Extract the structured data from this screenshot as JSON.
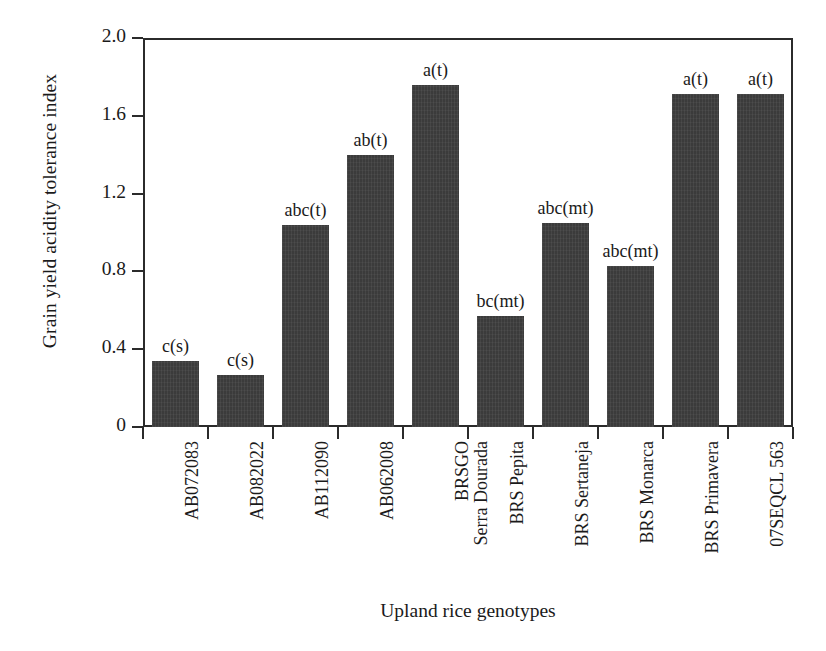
{
  "chart_data": {
    "type": "bar",
    "title": "",
    "xlabel": "Upland rice genotypes",
    "ylabel": "Grain yield acidity tolerance index",
    "ylim": [
      0,
      2.0
    ],
    "yticks": [
      "0",
      "0.4",
      "0.8",
      "1.2",
      "1.6",
      "2.0"
    ],
    "ytick_values": [
      0,
      0.4,
      0.8,
      1.2,
      1.6,
      2.0
    ],
    "grid": false,
    "legend": "none",
    "bar_color": "#3b3b3b",
    "axis_color": "#2b2b2b",
    "categories": [
      "AB072083",
      "AB082022",
      "AB112090",
      "AB062008",
      "BRSGO Serra Dourada",
      "BRS Pepita",
      "BRS Sertaneja",
      "BRS Monarca",
      "BRS Primavera",
      "07SEQCL 563"
    ],
    "category_lines": [
      [
        "AB072083"
      ],
      [
        "AB082022"
      ],
      [
        "AB112090"
      ],
      [
        "AB062008"
      ],
      [
        "BRSGO",
        "Serra Dourada"
      ],
      [
        "BRS Pepita"
      ],
      [
        "BRS Sertaneja"
      ],
      [
        "BRS Monarca"
      ],
      [
        "BRS Primavera"
      ],
      [
        "07SEQCL 563"
      ]
    ],
    "values": [
      0.34,
      0.27,
      1.04,
      1.4,
      1.76,
      0.57,
      1.05,
      0.83,
      1.71,
      1.71
    ],
    "annotations": [
      "c(s)",
      "c(s)",
      "abc(t)",
      "ab(t)",
      "a(t)",
      "bc(mt)",
      "abc(mt)",
      "abc(mt)",
      "a(t)",
      "a(t)"
    ]
  }
}
